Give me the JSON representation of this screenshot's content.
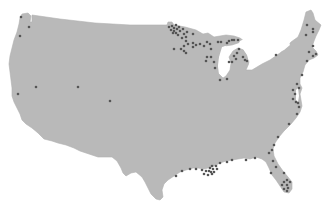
{
  "map": {
    "region": "Contiguous United States",
    "colors": {
      "land": "#b9b9b9",
      "water": "#ffffff",
      "marker": "#555555"
    },
    "marker_radius": 1.3,
    "markers": [
      {
        "x": 21,
        "y": 17
      },
      {
        "x": 29,
        "y": 27
      },
      {
        "x": 20,
        "y": 36
      },
      {
        "x": 18,
        "y": 94
      },
      {
        "x": 36,
        "y": 87
      },
      {
        "x": 78,
        "y": 87
      },
      {
        "x": 110,
        "y": 101
      },
      {
        "x": 169,
        "y": 27
      },
      {
        "x": 172,
        "y": 26
      },
      {
        "x": 174,
        "y": 28
      },
      {
        "x": 176,
        "y": 25
      },
      {
        "x": 171,
        "y": 30
      },
      {
        "x": 174,
        "y": 31
      },
      {
        "x": 177,
        "y": 29
      },
      {
        "x": 179,
        "y": 27
      },
      {
        "x": 173,
        "y": 33
      },
      {
        "x": 176,
        "y": 33
      },
      {
        "x": 180,
        "y": 31
      },
      {
        "x": 183,
        "y": 29
      },
      {
        "x": 178,
        "y": 35
      },
      {
        "x": 184,
        "y": 34
      },
      {
        "x": 187,
        "y": 32
      },
      {
        "x": 182,
        "y": 38
      },
      {
        "x": 186,
        "y": 37
      },
      {
        "x": 193,
        "y": 34
      },
      {
        "x": 186,
        "y": 41
      },
      {
        "x": 188,
        "y": 44
      },
      {
        "x": 184,
        "y": 46
      },
      {
        "x": 174,
        "y": 49
      },
      {
        "x": 181,
        "y": 49
      },
      {
        "x": 184,
        "y": 51
      },
      {
        "x": 186,
        "y": 53
      },
      {
        "x": 193,
        "y": 43
      },
      {
        "x": 196,
        "y": 45
      },
      {
        "x": 193,
        "y": 47
      },
      {
        "x": 200,
        "y": 44
      },
      {
        "x": 204,
        "y": 46
      },
      {
        "x": 207,
        "y": 42
      },
      {
        "x": 210,
        "y": 44
      },
      {
        "x": 211,
        "y": 49
      },
      {
        "x": 207,
        "y": 57
      },
      {
        "x": 206,
        "y": 61
      },
      {
        "x": 211,
        "y": 57
      },
      {
        "x": 214,
        "y": 62
      },
      {
        "x": 215,
        "y": 68
      },
      {
        "x": 218,
        "y": 42
      },
      {
        "x": 221,
        "y": 42
      },
      {
        "x": 227,
        "y": 43
      },
      {
        "x": 229,
        "y": 41
      },
      {
        "x": 232,
        "y": 40
      },
      {
        "x": 234,
        "y": 40
      },
      {
        "x": 238,
        "y": 40
      },
      {
        "x": 239,
        "y": 49
      },
      {
        "x": 237,
        "y": 53
      },
      {
        "x": 234,
        "y": 56
      },
      {
        "x": 236,
        "y": 59
      },
      {
        "x": 232,
        "y": 62
      },
      {
        "x": 229,
        "y": 62
      },
      {
        "x": 243,
        "y": 57
      },
      {
        "x": 245,
        "y": 60
      },
      {
        "x": 247,
        "y": 61
      },
      {
        "x": 220,
        "y": 80
      },
      {
        "x": 227,
        "y": 79
      },
      {
        "x": 276,
        "y": 55
      },
      {
        "x": 307,
        "y": 25
      },
      {
        "x": 313,
        "y": 29
      },
      {
        "x": 313,
        "y": 32
      },
      {
        "x": 306,
        "y": 35
      },
      {
        "x": 313,
        "y": 46
      },
      {
        "x": 309,
        "y": 52
      },
      {
        "x": 316,
        "y": 54
      },
      {
        "x": 313,
        "y": 56
      },
      {
        "x": 307,
        "y": 61
      },
      {
        "x": 302,
        "y": 75
      },
      {
        "x": 297,
        "y": 84
      },
      {
        "x": 299,
        "y": 88
      },
      {
        "x": 293,
        "y": 90
      },
      {
        "x": 295,
        "y": 94
      },
      {
        "x": 293,
        "y": 99
      },
      {
        "x": 296,
        "y": 102
      },
      {
        "x": 298,
        "y": 103
      },
      {
        "x": 299,
        "y": 107
      },
      {
        "x": 297,
        "y": 114
      },
      {
        "x": 289,
        "y": 124
      },
      {
        "x": 278,
        "y": 137
      },
      {
        "x": 274,
        "y": 145
      },
      {
        "x": 272,
        "y": 150
      },
      {
        "x": 269,
        "y": 153
      },
      {
        "x": 273,
        "y": 161
      },
      {
        "x": 276,
        "y": 167
      },
      {
        "x": 271,
        "y": 173
      },
      {
        "x": 284,
        "y": 173
      },
      {
        "x": 287,
        "y": 180
      },
      {
        "x": 284,
        "y": 182
      },
      {
        "x": 290,
        "y": 182
      },
      {
        "x": 282,
        "y": 185
      },
      {
        "x": 287,
        "y": 185
      },
      {
        "x": 288,
        "y": 188
      },
      {
        "x": 284,
        "y": 189
      },
      {
        "x": 287,
        "y": 191
      },
      {
        "x": 255,
        "y": 158
      },
      {
        "x": 246,
        "y": 160
      },
      {
        "x": 232,
        "y": 160
      },
      {
        "x": 227,
        "y": 162
      },
      {
        "x": 220,
        "y": 163
      },
      {
        "x": 216,
        "y": 166
      },
      {
        "x": 212,
        "y": 166
      },
      {
        "x": 210,
        "y": 168
      },
      {
        "x": 213,
        "y": 169
      },
      {
        "x": 217,
        "y": 169
      },
      {
        "x": 209,
        "y": 171
      },
      {
        "x": 211,
        "y": 172
      },
      {
        "x": 214,
        "y": 172
      },
      {
        "x": 206,
        "y": 171
      },
      {
        "x": 202,
        "y": 170
      },
      {
        "x": 212,
        "y": 174
      },
      {
        "x": 208,
        "y": 175
      },
      {
        "x": 204,
        "y": 174
      },
      {
        "x": 196,
        "y": 169
      },
      {
        "x": 190,
        "y": 169
      },
      {
        "x": 182,
        "y": 171
      },
      {
        "x": 176,
        "y": 176
      }
    ]
  }
}
